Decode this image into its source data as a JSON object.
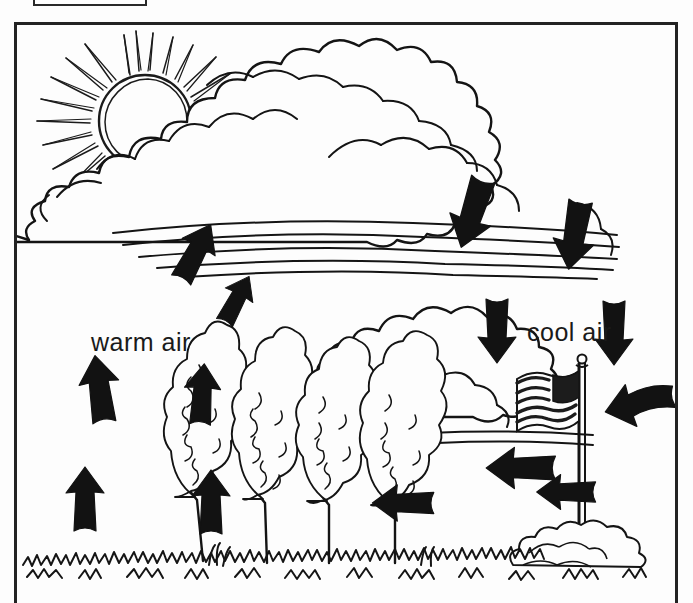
{
  "figure": {
    "title_box": {
      "present": true,
      "label": ""
    },
    "background_color": "#fdfdfd",
    "ink_color": "#1a1a1a",
    "frame_color": "#232323"
  },
  "labels": {
    "warm_air": "warm air",
    "cool_air": "cool air"
  },
  "scene": {
    "sun": {
      "name": "sun-icon",
      "description": "hand drawn sun with radiating rays",
      "center": [
        127,
        95
      ],
      "radius": 44,
      "ray_count": 40
    },
    "cloud_upper": {
      "name": "cumulus-cloud",
      "description": "large billowing cumulus cloud"
    },
    "cloud_lower": {
      "name": "lower-cloud",
      "description": "smaller cloud beneath the cumulus"
    },
    "ground": {
      "name": "grass-line",
      "description": "scribbled grass across the bottom"
    },
    "trees": {
      "name": "cypress-trees",
      "count": 4,
      "description": "four cypress trees bending to the left"
    },
    "flag": {
      "name": "flag-icon",
      "description": "american flag on a pole blowing left",
      "stripes": 7
    },
    "bush": {
      "name": "bush",
      "description": "shrub at the base of the flagpole"
    }
  },
  "arrows": [
    {
      "id": "warm-1",
      "group": "warm-air",
      "direction": "up",
      "x": 82,
      "y": 490,
      "angle": 0,
      "scale": 1.0
    },
    {
      "id": "warm-2",
      "group": "warm-air",
      "direction": "up",
      "x": 208,
      "y": 493,
      "angle": 0,
      "scale": 1.0
    },
    {
      "id": "warm-3",
      "group": "warm-air",
      "direction": "up",
      "x": 97,
      "y": 380,
      "angle": -8,
      "scale": 1.05
    },
    {
      "id": "warm-4",
      "group": "warm-air",
      "direction": "up",
      "x": 199,
      "y": 385,
      "angle": 4,
      "scale": 0.95
    },
    {
      "id": "warm-5",
      "group": "warm-air",
      "direction": "up-right",
      "x": 192,
      "y": 243,
      "angle": 28,
      "scale": 0.95
    },
    {
      "id": "warm-6",
      "group": "warm-air",
      "direction": "up-right",
      "x": 233,
      "y": 290,
      "angle": 28,
      "scale": 0.8
    },
    {
      "id": "cloud-1",
      "group": "cloud-downdraft",
      "direction": "down",
      "x": 470,
      "y": 200,
      "angle": 18,
      "scale": 1.1
    },
    {
      "id": "cloud-2",
      "group": "cloud-downdraft",
      "direction": "down",
      "x": 572,
      "y": 222,
      "angle": 10,
      "scale": 1.05
    },
    {
      "id": "cool-1",
      "group": "cool-air",
      "direction": "down",
      "x": 494,
      "y": 318,
      "angle": 0,
      "scale": 1.0
    },
    {
      "id": "cool-2",
      "group": "cool-air",
      "direction": "down",
      "x": 611,
      "y": 320,
      "angle": 0,
      "scale": 1.0
    },
    {
      "id": "wind-1",
      "group": "wind",
      "direction": "left",
      "x": 638,
      "y": 392,
      "angle": -14,
      "scale": 1.05
    },
    {
      "id": "wind-2",
      "group": "wind",
      "direction": "left",
      "x": 520,
      "y": 457,
      "angle": 0,
      "scale": 1.05
    },
    {
      "id": "wind-3",
      "group": "wind",
      "direction": "left",
      "x": 565,
      "y": 481,
      "angle": 0,
      "scale": 0.9
    },
    {
      "id": "wind-4",
      "group": "wind",
      "direction": "left",
      "x": 402,
      "y": 492,
      "angle": 0,
      "scale": 0.95
    }
  ],
  "legend": {
    "concept": "convection cycle: warm air rises, cools and condenses into cloud, cool air sinks and flows back along the ground as wind"
  }
}
